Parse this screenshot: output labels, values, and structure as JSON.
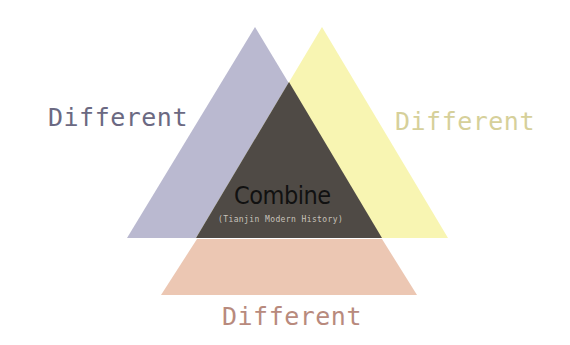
{
  "diagram": {
    "colors": {
      "left_triangle": "#bab9d0",
      "right_triangle": "#f8f5b2",
      "center_triangle": "#4f4a45",
      "bottom_trapezoid": "#ecc7b3",
      "left_text": "#6b6982",
      "right_text": "#d6d09a",
      "bottom_text": "#b88a7d",
      "center_text": "#111111",
      "subtitle_text": "#c8c3bb"
    },
    "labels": {
      "left": "Different",
      "right": "Different",
      "bottom": "Different",
      "center": "Combine",
      "center_subtitle": "(Tianjin Modern History)"
    }
  }
}
